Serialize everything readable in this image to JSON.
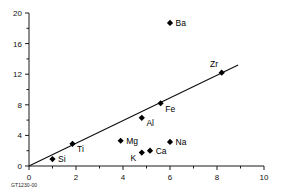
{
  "figure": {
    "caption": "GT1230-00"
  },
  "chart_data": {
    "type": "scatter",
    "title": "",
    "xlabel": "",
    "ylabel": "",
    "xlim": [
      0,
      10
    ],
    "ylim": [
      0,
      20
    ],
    "grid": false,
    "legend": "none",
    "x_ticks_major": [
      0,
      2,
      4,
      6,
      8,
      10
    ],
    "x_ticks_minor": [
      1,
      3,
      5,
      7,
      9
    ],
    "y_ticks_major": [
      0,
      4,
      8,
      12,
      16,
      20
    ],
    "y_ticks_minor": [
      2,
      6,
      10,
      14,
      18
    ],
    "x_tick_labels": [
      "0",
      "2",
      "4",
      "6",
      "8",
      "10"
    ],
    "y_tick_labels": [
      "0",
      "4",
      "8",
      "12",
      "16",
      "20"
    ],
    "points": [
      {
        "label": "Si",
        "x": 1.0,
        "y": 0.9,
        "label_pos": "right"
      },
      {
        "label": "Ti",
        "x": 1.85,
        "y": 2.9,
        "label_pos": "below-right"
      },
      {
        "label": "Mg",
        "x": 3.9,
        "y": 3.3,
        "label_pos": "right"
      },
      {
        "label": "K",
        "x": 4.8,
        "y": 1.75,
        "label_pos": "below-left"
      },
      {
        "label": "Al",
        "x": 4.8,
        "y": 6.3,
        "label_pos": "below-right"
      },
      {
        "label": "Ca",
        "x": 5.15,
        "y": 2.0,
        "label_pos": "right"
      },
      {
        "label": "Fe",
        "x": 5.6,
        "y": 8.2,
        "label_pos": "below-right"
      },
      {
        "label": "Na",
        "x": 6.0,
        "y": 3.15,
        "label_pos": "right"
      },
      {
        "label": "Ba",
        "x": 6.0,
        "y": 18.7,
        "label_pos": "right"
      },
      {
        "label": "Zr",
        "x": 8.2,
        "y": 12.2,
        "label_pos": "above-left"
      }
    ],
    "trend_line": {
      "x_start": 0.0,
      "y_start": 0.0,
      "x_end": 8.9,
      "y_end": 13.2
    },
    "colors": {
      "marker": "#000000",
      "line": "#0d0d0d",
      "axis": "#1a1a1a",
      "background": "#ffffff"
    }
  }
}
